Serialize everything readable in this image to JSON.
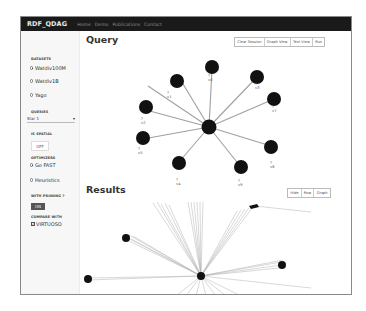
{
  "navbar": {
    "brand": "RDF_QDAG",
    "links": [
      "Home",
      "Demo",
      "Publications",
      "Contact"
    ]
  },
  "sidebar": {
    "datasets": {
      "label": "DATASETS",
      "options": [
        {
          "label": "Watdiv100M",
          "selected": true
        },
        {
          "label": "Watdiv1B",
          "selected": false
        },
        {
          "label": "Yago",
          "selected": false
        }
      ]
    },
    "queries": {
      "label": "QUERIES",
      "selected": "Star 1",
      "arrow": "▾"
    },
    "is_spatial": {
      "label": "IS SPATIAL",
      "button": "OFF"
    },
    "optimizers": {
      "label": "OPTIMIZERS",
      "options": [
        {
          "label": "Go FAST",
          "selected": true
        },
        {
          "label": "Heuristics",
          "selected": false
        }
      ]
    },
    "with_pruning": {
      "label": "WITH PRUNING ?",
      "button": "ON"
    },
    "compare_with": {
      "label": "COMPARE WITH",
      "checkbox_label": "VIRTUOSO",
      "checked": true,
      "check_mark": "✓"
    }
  },
  "query": {
    "title": "Query",
    "buttons": [
      "Clear Session",
      "Graph View",
      "Text View",
      "Run"
    ],
    "graph": {
      "center_label": "",
      "nodes": [
        {
          "label": "?v0"
        },
        {
          "label": "?v1"
        },
        {
          "label": "?v2"
        },
        {
          "label": "?v3"
        },
        {
          "label": "?v4"
        },
        {
          "label": "?v5"
        },
        {
          "label": "?v6"
        },
        {
          "label": "?v7"
        },
        {
          "label": "?v8"
        },
        {
          "label": "?v9"
        }
      ]
    }
  },
  "results": {
    "title": "Results",
    "buttons": [
      "Hide",
      "Row",
      "Graph"
    ]
  },
  "colors": {
    "navbar_bg": "#1a1a1a",
    "node_fill": "#111111",
    "edge": "#9a9a9a",
    "sidebar_bg": "#f7f7f7",
    "on_button": "#555555"
  }
}
